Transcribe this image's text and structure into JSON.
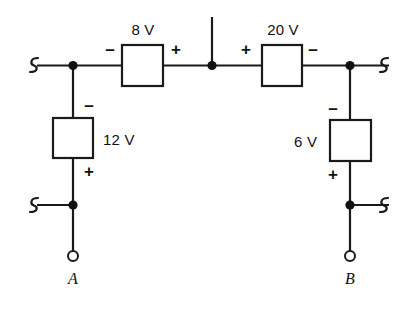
{
  "diagram": {
    "background_color": "#ffffff",
    "line_color": "#1a1a1a",
    "text_color": "#111111"
  },
  "sources": {
    "top_left": {
      "value": "8 V",
      "left_polarity": "–",
      "right_polarity": "+",
      "orientation": "horizontal"
    },
    "top_right": {
      "value": "20 V",
      "left_polarity": "+",
      "right_polarity": "–",
      "orientation": "horizontal"
    },
    "left_branch": {
      "value": "12 V",
      "top_polarity": "–",
      "bottom_polarity": "+",
      "orientation": "vertical"
    },
    "right_branch": {
      "value": "6 V",
      "top_polarity": "–",
      "bottom_polarity": "+",
      "orientation": "vertical"
    }
  },
  "terminals": {
    "left": "A",
    "right": "B"
  },
  "wire_breaks": {
    "top_left": "break-squiggle",
    "top_right": "break-squiggle",
    "bottom_left": "break-squiggle",
    "bottom_right": "break-squiggle"
  },
  "nodes": {
    "count": 5,
    "names": [
      "top-left-node",
      "top-center-node",
      "top-right-node",
      "bottom-left-node",
      "bottom-right-node"
    ]
  }
}
